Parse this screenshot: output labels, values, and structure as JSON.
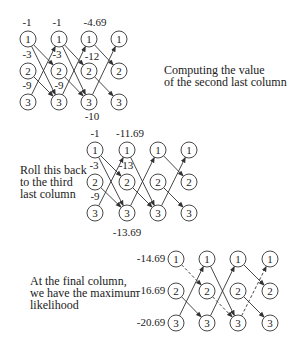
{
  "captions": [
    {
      "id": "caption-computing",
      "lines": [
        "Computing the value",
        "of the second last column"
      ],
      "x": 164,
      "y": 64
    },
    {
      "id": "caption-rollback",
      "lines": [
        "Roll this back",
        "to the third",
        "last column"
      ],
      "x": 20,
      "y": 164
    },
    {
      "id": "caption-final",
      "lines": [
        "At the final column,",
        "we have the maximum",
        "likelihood"
      ],
      "x": 30,
      "y": 275
    }
  ],
  "node_labels": [
    "1",
    "2",
    "3"
  ],
  "diagrams": [
    {
      "id": "trellis-1",
      "cols": [
        28,
        59,
        89,
        119
      ],
      "rows": [
        39,
        71,
        102
      ],
      "edges": [
        {
          "from": [
            0,
            0
          ],
          "to": [
            1,
            1
          ],
          "style": "solid"
        },
        {
          "from": [
            0,
            0
          ],
          "to": [
            1,
            2
          ],
          "style": "solid"
        },
        {
          "from": [
            0,
            1
          ],
          "to": [
            1,
            2
          ],
          "style": "solid"
        },
        {
          "from": [
            0,
            2
          ],
          "to": [
            1,
            0
          ],
          "style": "solid"
        },
        {
          "from": [
            1,
            0
          ],
          "to": [
            2,
            1
          ],
          "style": "solid"
        },
        {
          "from": [
            1,
            0
          ],
          "to": [
            2,
            2
          ],
          "style": "solid"
        },
        {
          "from": [
            1,
            1
          ],
          "to": [
            2,
            2
          ],
          "style": "solid"
        },
        {
          "from": [
            1,
            2
          ],
          "to": [
            2,
            0
          ],
          "style": "solid"
        },
        {
          "from": [
            2,
            0
          ],
          "to": [
            3,
            1
          ],
          "style": "solid"
        },
        {
          "from": [
            2,
            1
          ],
          "to": [
            3,
            2
          ],
          "style": "solid"
        },
        {
          "from": [
            2,
            2
          ],
          "to": [
            3,
            0
          ],
          "style": "solid"
        }
      ],
      "values": [
        {
          "text": "-1",
          "x": 27,
          "y": 26
        },
        {
          "text": "-3",
          "x": 27,
          "y": 58
        },
        {
          "text": "-9",
          "x": 27,
          "y": 89
        },
        {
          "text": "-1",
          "x": 57,
          "y": 26
        },
        {
          "text": "-3",
          "x": 57,
          "y": 58
        },
        {
          "text": "-9",
          "x": 59,
          "y": 89
        },
        {
          "text": "-4.69",
          "x": 95,
          "y": 26
        },
        {
          "text": "-12",
          "x": 92,
          "y": 60
        },
        {
          "text": "-10",
          "x": 92,
          "y": 120
        }
      ]
    },
    {
      "id": "trellis-2",
      "cols": [
        95,
        127,
        158,
        189
      ],
      "rows": [
        150,
        182,
        213
      ],
      "edges": [
        {
          "from": [
            0,
            0
          ],
          "to": [
            1,
            1
          ],
          "style": "solid"
        },
        {
          "from": [
            0,
            0
          ],
          "to": [
            1,
            2
          ],
          "style": "solid"
        },
        {
          "from": [
            0,
            1
          ],
          "to": [
            1,
            2
          ],
          "style": "solid"
        },
        {
          "from": [
            0,
            2
          ],
          "to": [
            1,
            0
          ],
          "style": "solid"
        },
        {
          "from": [
            1,
            0
          ],
          "to": [
            2,
            2
          ],
          "style": "solid"
        },
        {
          "from": [
            1,
            1
          ],
          "to": [
            2,
            2
          ],
          "style": "solid"
        },
        {
          "from": [
            1,
            2
          ],
          "to": [
            2,
            0
          ],
          "style": "solid"
        },
        {
          "from": [
            2,
            0
          ],
          "to": [
            3,
            1
          ],
          "style": "solid"
        },
        {
          "from": [
            2,
            1
          ],
          "to": [
            3,
            2
          ],
          "style": "solid"
        },
        {
          "from": [
            2,
            2
          ],
          "to": [
            3,
            0
          ],
          "style": "solid"
        }
      ],
      "values": [
        {
          "text": "-1",
          "x": 95,
          "y": 137
        },
        {
          "text": "-3",
          "x": 94,
          "y": 169
        },
        {
          "text": "-9",
          "x": 95,
          "y": 200
        },
        {
          "text": "-11.69",
          "x": 130,
          "y": 137
        },
        {
          "text": "-13",
          "x": 126,
          "y": 169
        },
        {
          "text": "-13.69",
          "x": 127,
          "y": 236
        }
      ]
    },
    {
      "id": "trellis-3",
      "cols": [
        176,
        207,
        238,
        270
      ],
      "rows": [
        259,
        291,
        323
      ],
      "edges": [
        {
          "from": [
            0,
            0
          ],
          "to": [
            1,
            1
          ],
          "style": "dashed"
        },
        {
          "from": [
            0,
            1
          ],
          "to": [
            1,
            2
          ],
          "style": "solid"
        },
        {
          "from": [
            0,
            2
          ],
          "to": [
            1,
            0
          ],
          "style": "solid"
        },
        {
          "from": [
            1,
            0
          ],
          "to": [
            2,
            2
          ],
          "style": "solid"
        },
        {
          "from": [
            1,
            1
          ],
          "to": [
            2,
            2
          ],
          "style": "dashed"
        },
        {
          "from": [
            1,
            2
          ],
          "to": [
            2,
            0
          ],
          "style": "solid"
        },
        {
          "from": [
            2,
            0
          ],
          "to": [
            3,
            1
          ],
          "style": "solid"
        },
        {
          "from": [
            2,
            1
          ],
          "to": [
            3,
            2
          ],
          "style": "solid"
        },
        {
          "from": [
            2,
            2
          ],
          "to": [
            3,
            0
          ],
          "style": "dashed"
        }
      ],
      "values": [
        {
          "text": "-14.69",
          "x": 151,
          "y": 262,
          "anchor": "middle"
        },
        {
          "text": "-16.69",
          "x": 151,
          "y": 294,
          "anchor": "middle"
        },
        {
          "text": "-20.69",
          "x": 151,
          "y": 326,
          "anchor": "middle"
        }
      ]
    }
  ]
}
